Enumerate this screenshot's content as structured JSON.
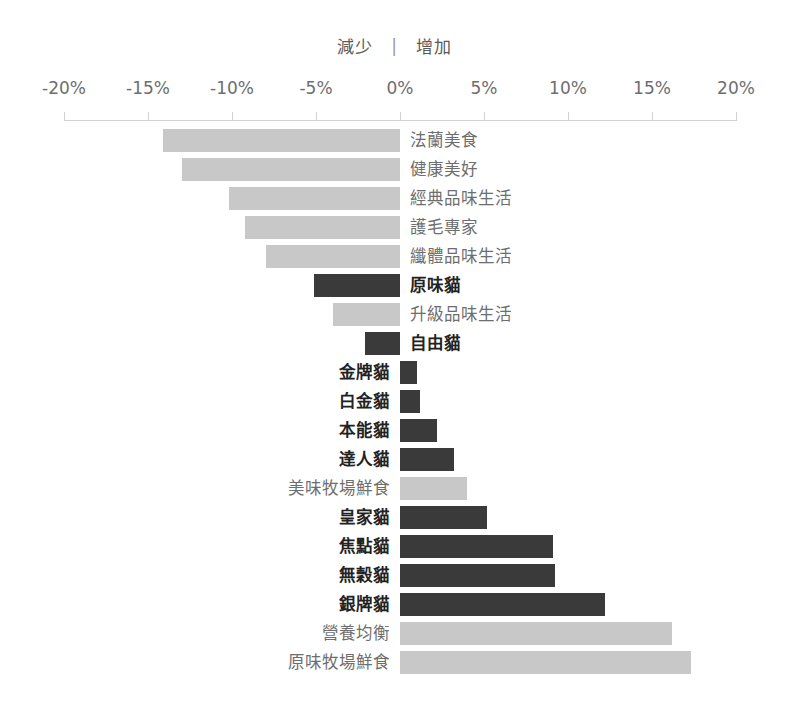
{
  "caption": {
    "decrease": "減少",
    "separator": "|",
    "increase": "增加"
  },
  "colors": {
    "bar_light": "#c8c8c8",
    "bar_dark": "#3a3a3a",
    "axis": "#d2d2d2",
    "label_plain": "#6e6e6e",
    "label_highlight": "#222222"
  },
  "axis": {
    "ticks": [
      "-20%",
      "-15%",
      "-10%",
      "-5%",
      "0%",
      "5%",
      "10%",
      "15%",
      "20%"
    ],
    "tick_values": [
      -20,
      -15,
      -10,
      -5,
      0,
      5,
      10,
      15,
      20
    ]
  },
  "chart_data": {
    "type": "bar",
    "orientation": "horizontal",
    "title": "",
    "subtitle": "減少 | 增加",
    "xlabel": "",
    "ylabel": "",
    "xlim": [
      -20,
      20
    ],
    "grid": false,
    "legend": "none",
    "value_unit": "%",
    "categories": [
      "法蘭美食",
      "健康美好",
      "經典品味生活",
      "護毛專家",
      "纖體品味生活",
      "原味貓",
      "升級品味生活",
      "自由貓",
      "金牌貓",
      "白金貓",
      "本能貓",
      "達人貓",
      "美味牧場鮮食",
      "皇家貓",
      "焦點貓",
      "無穀貓",
      "銀牌貓",
      "營養均衡",
      "原味牧場鮮食"
    ],
    "values": [
      -14.1,
      -13.0,
      -10.2,
      -9.2,
      -8.0,
      -5.1,
      -4.0,
      -2.1,
      1.0,
      1.2,
      2.2,
      3.2,
      4.0,
      5.2,
      9.1,
      9.2,
      12.2,
      16.2,
      17.3
    ],
    "highlighted": [
      false,
      false,
      false,
      false,
      false,
      true,
      false,
      true,
      true,
      true,
      true,
      true,
      false,
      true,
      true,
      true,
      true,
      false,
      false
    ]
  }
}
